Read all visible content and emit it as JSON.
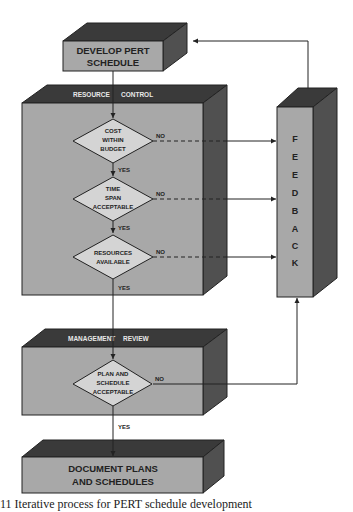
{
  "colors": {
    "front_face": "#a8a8a8",
    "top_face": "#3a3a3a",
    "side_face": "#505050",
    "diamond": "#d4d4d4",
    "line": "#222222",
    "label_light": "#e8e8e8"
  },
  "boxes": {
    "develop": {
      "line1": "DEVELOP PERT",
      "line2": "SCHEDULE"
    },
    "resource_control": {
      "title_a": "RESOURCE",
      "title_b": "CONTROL"
    },
    "feedback": {
      "letters": [
        "F",
        "E",
        "E",
        "D",
        "B",
        "A",
        "C",
        "K"
      ]
    },
    "management_review": {
      "title_a": "MANAGEMENT",
      "title_b": "REVIEW"
    },
    "document": {
      "line1": "DOCUMENT PLANS",
      "line2": "AND SCHEDULES"
    }
  },
  "decisions": {
    "cost": {
      "lines": [
        "COST",
        "WITHIN",
        "BUDGET"
      ],
      "yes": "YES",
      "no": "NO"
    },
    "time": {
      "lines": [
        "TIME",
        "SPAN",
        "ACCEPTABLE"
      ],
      "yes": "YES",
      "no": "NO"
    },
    "resources": {
      "lines": [
        "RESOURCES",
        "AVAILABLE"
      ],
      "yes": "YES",
      "no": "NO"
    },
    "plan": {
      "lines": [
        "PLAN AND",
        "SCHEDULE",
        "ACCEPTABLE"
      ],
      "yes": "YES",
      "no": "NO"
    }
  },
  "caption": "11   Iterative process for PERT schedule development"
}
